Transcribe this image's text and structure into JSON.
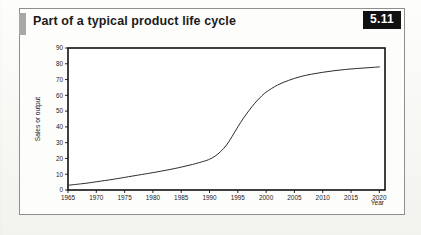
{
  "figure": {
    "title": "Part of a typical product life cycle",
    "badge": "5.11",
    "accent_color": "#a8a8a8",
    "badge_bg": "#111111",
    "badge_fg": "#ffffff",
    "frame_color": "#8e8e8e"
  },
  "chart_data": {
    "type": "line",
    "title": "Part of a typical product life cycle",
    "xlabel": "Year",
    "ylabel": "Sales or output",
    "xlim": [
      1965,
      2021
    ],
    "ylim": [
      0,
      90
    ],
    "grid": false,
    "legend": "none",
    "line_color": "#2c2c2c",
    "xticks": [
      1965,
      1970,
      1975,
      1980,
      1985,
      1990,
      1995,
      2000,
      2005,
      2010,
      2015,
      2020
    ],
    "xtick_labels": [
      "1965",
      "1970",
      "1975",
      "1980",
      "1985",
      "1990",
      "1995",
      "2000",
      "2005",
      "2010",
      "2015",
      "2020"
    ],
    "yticks": [
      0,
      10,
      20,
      30,
      40,
      50,
      60,
      70,
      80,
      90
    ],
    "ytick_labels": [
      "0",
      "10",
      "20",
      "30",
      "40",
      "50",
      "60",
      "70",
      "80",
      "90"
    ],
    "series": [
      {
        "name": "Sales or output",
        "x": [
          1965,
          1968,
          1970,
          1973,
          1975,
          1978,
          1980,
          1983,
          1985,
          1987,
          1989,
          1990,
          1991,
          1992,
          1993,
          1994,
          1995,
          1996,
          1997,
          1998,
          1999,
          2000,
          2002,
          2004,
          2006,
          2008,
          2010,
          2012,
          2014,
          2016,
          2018,
          2020
        ],
        "y": [
          3,
          4.2,
          5.2,
          6.8,
          8,
          9.8,
          11,
          13,
          14.5,
          16.2,
          18.2,
          19.5,
          21.5,
          24.5,
          28.5,
          34,
          40,
          45.5,
          50.5,
          55,
          58.8,
          62,
          66.5,
          69.5,
          71.8,
          73.4,
          74.6,
          75.6,
          76.4,
          77,
          77.5,
          78
        ]
      }
    ]
  }
}
